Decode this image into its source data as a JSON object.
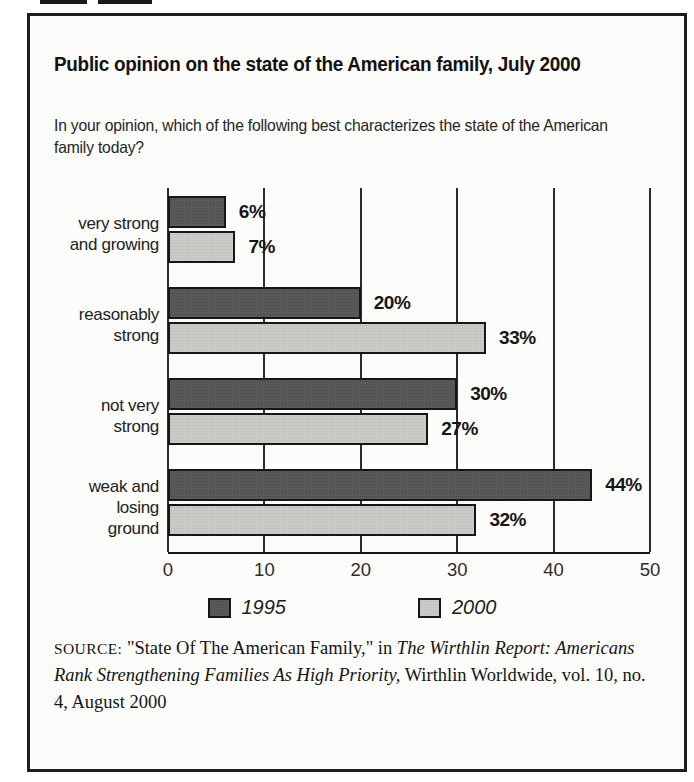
{
  "header": {
    "title": "Public opinion on the state of the American family, July 2000",
    "question": "In your opinion, which of the following best characterizes the state of the American\nfamily today?"
  },
  "chart_data": {
    "type": "bar",
    "orientation": "horizontal",
    "title": "Public opinion on the state of the American family, July 2000",
    "categories": [
      "very strong\nand growing",
      "reasonably\nstrong",
      "not very\nstrong",
      "weak and\nlosing\nground"
    ],
    "series": [
      {
        "name": "1995",
        "color": "#57595b",
        "values": [
          6,
          20,
          30,
          44
        ]
      },
      {
        "name": "2000",
        "color": "#c9cbc7",
        "values": [
          7,
          33,
          27,
          32
        ]
      }
    ],
    "value_label_suffix": "%",
    "xlim": [
      0,
      50
    ],
    "x_ticks": [
      0,
      10,
      20,
      30,
      40,
      50
    ],
    "grid": "vertical",
    "legend_position": "bottom"
  },
  "legend": {
    "items": [
      {
        "label": "1995",
        "color": "#57595b"
      },
      {
        "label": "2000",
        "color": "#c9cbc7"
      }
    ]
  },
  "source": {
    "label": "SOURCE:",
    "text_before_italic": " \"State Of The American Family,\" in ",
    "italic_text": "The Wirthlin Report: Americans Rank Strengthening Families As High Priority,",
    "text_after_italic": " Wirthlin Worldwide, vol. 10, no. 4, August 2000"
  }
}
